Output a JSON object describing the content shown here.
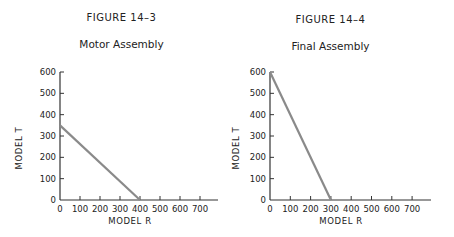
{
  "chart_data": [
    {
      "type": "line",
      "figure_label": "FIGURE 14–3",
      "title": "Motor Assembly",
      "xlabel": "MODEL R",
      "ylabel": "MODEL T",
      "xlim": [
        0,
        750
      ],
      "ylim": [
        0,
        600
      ],
      "xticks": [
        0,
        100,
        200,
        300,
        400,
        500,
        600,
        700
      ],
      "yticks": [
        0,
        100,
        200,
        300,
        400,
        500,
        600
      ],
      "grid": false,
      "series": [
        {
          "name": "constraint",
          "x": [
            0,
            400
          ],
          "y": [
            350,
            0
          ],
          "color": "#8a8a8a"
        }
      ]
    },
    {
      "type": "line",
      "figure_label": "FIGURE 14–4",
      "title": "Final Assembly",
      "xlabel": "MODEL R",
      "ylabel": "MODEL T",
      "xlim": [
        0,
        750
      ],
      "ylim": [
        0,
        600
      ],
      "xticks": [
        0,
        100,
        200,
        300,
        400,
        500,
        600,
        700
      ],
      "yticks": [
        0,
        100,
        200,
        300,
        400,
        500,
        600
      ],
      "grid": false,
      "series": [
        {
          "name": "constraint",
          "x": [
            0,
            300
          ],
          "y": [
            600,
            0
          ],
          "color": "#8a8a8a"
        }
      ]
    }
  ]
}
